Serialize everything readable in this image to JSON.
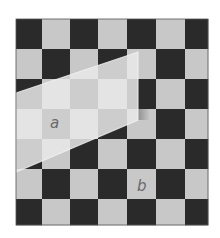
{
  "figure": {
    "board": {
      "left": 16,
      "top": 19,
      "col_edges": [
        16,
        42,
        70,
        98,
        127,
        156,
        185,
        208
      ],
      "row_edges": [
        19,
        49,
        79,
        109,
        139,
        169,
        199,
        225
      ],
      "dark_when_sum_even": true
    },
    "colors": {
      "background": "#ffffff",
      "light_cell": "#c8c8c8",
      "dark_cell": "#2a2a2a",
      "lit_light_cell": "#e4e4e4",
      "lit_dark_cell": "#cdcdcd",
      "border": "#555555",
      "label": "#6a6a6a"
    },
    "lit_region": {
      "polygon": [
        [
          16,
          93
        ],
        [
          138,
          52
        ],
        [
          138,
          120
        ],
        [
          16,
          172
        ]
      ]
    },
    "labels": [
      {
        "text": "a",
        "x": 50,
        "y": 116,
        "cell": "row 4, col 2"
      },
      {
        "text": "b",
        "x": 137,
        "y": 179,
        "cell": "row 6, col 5"
      }
    ]
  }
}
